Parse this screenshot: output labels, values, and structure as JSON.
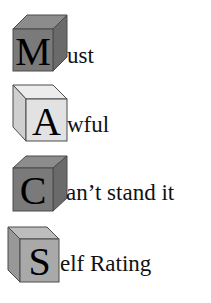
{
  "items": [
    {
      "letter": "M",
      "rest": "ust",
      "word": "Must",
      "cube_style": "dark",
      "orientation": "right-side"
    },
    {
      "letter": "A",
      "rest": "wful",
      "word": "Awful",
      "cube_style": "light",
      "orientation": "left-side"
    },
    {
      "letter": "C",
      "rest": "an’t stand it",
      "word": "Can’t stand it",
      "cube_style": "dark",
      "orientation": "right-side"
    },
    {
      "letter": "S",
      "rest": "elf Rating",
      "word": "Self Rating",
      "cube_style": "medium",
      "orientation": "left-side"
    }
  ],
  "colors": {
    "dark_front": "#7a7a7a",
    "dark_top": "#8c8c8c",
    "dark_side": "#6a6a6a",
    "light_front": "#e2e2e2",
    "light_top": "#ececec",
    "light_side": "#cfcfcf",
    "medium_front": "#a9a9a9",
    "medium_top": "#bdbdbd",
    "medium_side": "#989898",
    "edge": "#4a4a4a"
  }
}
